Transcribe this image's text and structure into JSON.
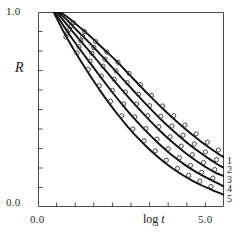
{
  "chart_data": {
    "type": "line",
    "title": "",
    "xlabel": "log t",
    "ylabel": "R",
    "xlim": [
      0.0,
      5.0
    ],
    "ylim": [
      0.0,
      1.0
    ],
    "grid": false,
    "legend_position": "right-edge",
    "x_tick_labels": [
      "0.0",
      "5.0"
    ],
    "y_tick_labels": [
      "1.0",
      "0.0"
    ],
    "x_major_ticks": [
      0.0,
      5.0
    ],
    "x_minor_ticks": [
      0.5,
      1.0,
      1.5,
      2.0,
      2.5,
      3.0,
      3.5,
      4.0,
      4.5
    ],
    "y_minor_ticks": [
      0.1,
      0.2,
      0.3,
      0.4,
      0.5,
      0.6,
      0.7,
      0.8,
      0.9
    ],
    "marker": "open-circle",
    "line_color": "#111111",
    "marker_color": "#333333",
    "series": [
      {
        "name": "1",
        "label": "1",
        "x": [
          0.6,
          0.85,
          1.1,
          1.35,
          1.6,
          1.85,
          2.1,
          2.35,
          2.6,
          2.85,
          3.1,
          3.35,
          3.6,
          3.85,
          4.1,
          4.35,
          4.6,
          4.85,
          5.0
        ],
        "y": [
          1.0,
          0.965,
          0.925,
          0.885,
          0.84,
          0.795,
          0.75,
          0.7,
          0.65,
          0.6,
          0.552,
          0.505,
          0.46,
          0.418,
          0.378,
          0.34,
          0.305,
          0.272,
          0.255
        ]
      },
      {
        "name": "2",
        "label": "2",
        "x": [
          0.55,
          0.8,
          1.05,
          1.3,
          1.55,
          1.8,
          2.05,
          2.3,
          2.55,
          2.8,
          3.05,
          3.3,
          3.55,
          3.8,
          4.05,
          4.3,
          4.55,
          4.8,
          5.0
        ],
        "y": [
          1.0,
          0.955,
          0.905,
          0.858,
          0.808,
          0.757,
          0.705,
          0.652,
          0.6,
          0.548,
          0.498,
          0.45,
          0.405,
          0.363,
          0.323,
          0.287,
          0.253,
          0.222,
          0.2
        ]
      },
      {
        "name": "3",
        "label": "3",
        "x": [
          0.5,
          0.75,
          1.0,
          1.25,
          1.5,
          1.75,
          2.0,
          2.25,
          2.5,
          2.75,
          3.0,
          3.25,
          3.5,
          3.75,
          4.0,
          4.25,
          4.5,
          4.75,
          5.0
        ],
        "y": [
          1.0,
          0.942,
          0.884,
          0.828,
          0.772,
          0.715,
          0.658,
          0.602,
          0.548,
          0.495,
          0.444,
          0.396,
          0.351,
          0.31,
          0.272,
          0.237,
          0.206,
          0.178,
          0.158
        ]
      },
      {
        "name": "4",
        "label": "4",
        "x": [
          0.45,
          0.7,
          0.95,
          1.2,
          1.45,
          1.7,
          1.95,
          2.2,
          2.45,
          2.7,
          2.95,
          3.2,
          3.45,
          3.7,
          3.95,
          4.2,
          4.45,
          4.7,
          5.0
        ],
        "y": [
          1.0,
          0.925,
          0.855,
          0.79,
          0.726,
          0.662,
          0.6,
          0.54,
          0.483,
          0.43,
          0.38,
          0.333,
          0.29,
          0.251,
          0.216,
          0.185,
          0.158,
          0.134,
          0.105
        ]
      },
      {
        "name": "5",
        "label": "5",
        "x": [
          0.42,
          0.67,
          0.92,
          1.17,
          1.42,
          1.67,
          1.92,
          2.17,
          2.42,
          2.67,
          2.92,
          3.17,
          3.42,
          3.67,
          3.92,
          4.17,
          4.42,
          4.67,
          5.0
        ],
        "y": [
          1.0,
          0.905,
          0.82,
          0.742,
          0.668,
          0.597,
          0.53,
          0.468,
          0.41,
          0.357,
          0.309,
          0.265,
          0.226,
          0.191,
          0.16,
          0.133,
          0.109,
          0.088,
          0.062
        ]
      }
    ],
    "scatter_points": [
      {
        "series": "1",
        "x": [
          0.95,
          1.25,
          1.55,
          1.85,
          2.15,
          2.45,
          2.75,
          3.05,
          3.35,
          3.65,
          3.95,
          4.25,
          4.55,
          4.85
        ],
        "y": [
          0.945,
          0.9,
          0.848,
          0.795,
          0.742,
          0.685,
          0.628,
          0.572,
          0.518,
          0.468,
          0.42,
          0.375,
          0.332,
          0.292
        ]
      },
      {
        "series": "2",
        "x": [
          0.9,
          1.2,
          1.5,
          1.8,
          2.1,
          2.4,
          2.7,
          3.0,
          3.3,
          3.6,
          3.9,
          4.2,
          4.5,
          4.8
        ],
        "y": [
          0.93,
          0.875,
          0.818,
          0.758,
          0.698,
          0.638,
          0.578,
          0.52,
          0.465,
          0.415,
          0.368,
          0.323,
          0.282,
          0.243
        ]
      },
      {
        "series": "3",
        "x": [
          0.85,
          1.15,
          1.45,
          1.75,
          2.05,
          2.35,
          2.65,
          2.95,
          3.25,
          3.55,
          3.85,
          4.15,
          4.45,
          4.75
        ],
        "y": [
          0.912,
          0.852,
          0.788,
          0.722,
          0.655,
          0.59,
          0.528,
          0.468,
          0.412,
          0.36,
          0.312,
          0.268,
          0.228,
          0.192
        ]
      },
      {
        "series": "4",
        "x": [
          0.8,
          1.1,
          1.4,
          1.7,
          2.0,
          2.3,
          2.6,
          2.9,
          3.2,
          3.5,
          3.8,
          4.1,
          4.4,
          4.7
        ],
        "y": [
          0.892,
          0.822,
          0.748,
          0.672,
          0.598,
          0.528,
          0.462,
          0.402,
          0.348,
          0.298,
          0.253,
          0.213,
          0.178,
          0.148
        ]
      },
      {
        "series": "5",
        "x": [
          0.75,
          1.05,
          1.35,
          1.65,
          1.95,
          2.25,
          2.55,
          2.85,
          3.15,
          3.45,
          3.75,
          4.05,
          4.35,
          4.65
        ],
        "y": [
          0.872,
          0.79,
          0.705,
          0.622,
          0.542,
          0.468,
          0.4,
          0.34,
          0.288,
          0.24,
          0.198,
          0.162,
          0.132,
          0.105
        ]
      }
    ]
  },
  "axes": {
    "y_top_label": "1.0",
    "y_bottom_label": "0.0",
    "x_left_label": "0.0",
    "x_right_label": "5.0",
    "y_title": "R",
    "x_title_prefix": "log ",
    "x_title_var": "t"
  },
  "legend": {
    "labels": [
      "1",
      "2",
      "3",
      "4",
      "5"
    ]
  },
  "colors": {
    "line": "#111111",
    "marker": "#333333",
    "axis": "#4a4a4a",
    "text": "#1a1a1a",
    "background": "#ffffff"
  }
}
